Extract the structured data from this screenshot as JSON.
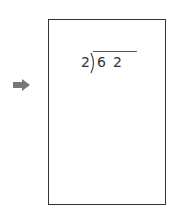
{
  "pointer": {
    "icon": "right-arrow-icon",
    "color": "#777777"
  },
  "worksheet": {
    "problem": {
      "divisor": "2",
      "dividend": "62",
      "dividend_digits": [
        "6",
        "2"
      ]
    },
    "border_color": "#333333"
  }
}
